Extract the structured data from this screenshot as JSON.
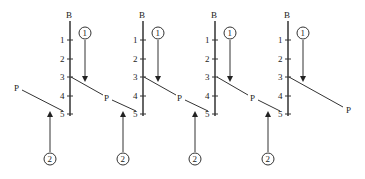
{
  "axis": {
    "top_label": "B",
    "ticks": [
      "1",
      "2",
      "3",
      "4",
      "5"
    ]
  },
  "ray_label": "P",
  "arrow_labels": {
    "top": "1",
    "bottom": "2"
  },
  "panels": [
    {
      "axis_x": 70,
      "p_start": [
        22,
        90
      ],
      "p_end": [
        63,
        111
      ],
      "p_label": [
        18,
        88
      ]
    },
    {
      "axis_x": 143,
      "p_start": [
        71,
        77
      ],
      "p_end": [
        136,
        111
      ],
      "p_label": [
        106,
        100
      ]
    },
    {
      "axis_x": 215,
      "p_start": [
        144,
        77
      ],
      "p_end": [
        208,
        111
      ],
      "p_label": [
        179,
        100
      ]
    },
    {
      "axis_x": 288,
      "p_start": [
        217,
        77
      ],
      "p_end": [
        280,
        111
      ],
      "p_label": [
        251,
        100
      ]
    },
    {
      "axis_x": 360,
      "p_start": [
        289,
        77
      ],
      "p_end": [
        345,
        108
      ],
      "p_label": [
        348,
        113
      ]
    }
  ]
}
